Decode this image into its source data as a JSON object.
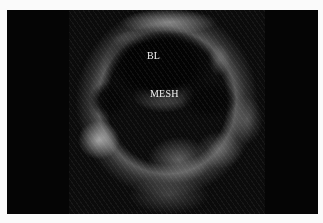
{
  "image": {
    "kind": "ultrasound-scan",
    "background_color": "#fafafa",
    "frame_color": "#050505"
  },
  "labels": {
    "bl": "BL",
    "mesh": "MESH"
  }
}
